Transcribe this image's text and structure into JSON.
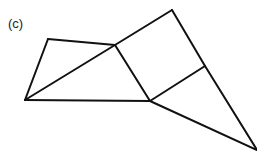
{
  "figure": {
    "label": "(c)",
    "stroke_color": "#111111",
    "stroke_width": 2,
    "vertices": {
      "A": [
        25,
        100
      ],
      "B": [
        48,
        39
      ],
      "C": [
        115,
        45
      ],
      "D": [
        172,
        10
      ],
      "E": [
        150,
        101
      ],
      "F": [
        205,
        66
      ],
      "G": [
        257,
        150
      ]
    },
    "edges": [
      [
        "A",
        "B"
      ],
      [
        "B",
        "C"
      ],
      [
        "A",
        "C"
      ],
      [
        "C",
        "D"
      ],
      [
        "A",
        "E"
      ],
      [
        "C",
        "E"
      ],
      [
        "D",
        "F"
      ],
      [
        "F",
        "G"
      ],
      [
        "E",
        "F"
      ],
      [
        "E",
        "G"
      ]
    ]
  }
}
